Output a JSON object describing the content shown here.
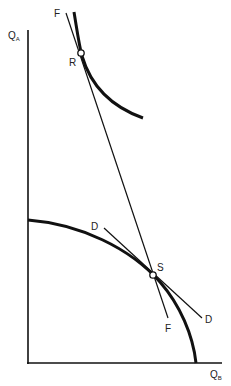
{
  "diagram": {
    "axes": {
      "y_label_main": "Q",
      "y_label_sub": "A",
      "x_label_main": "Q",
      "x_label_sub": "B"
    },
    "curves": {
      "production_possibility_frontier": "bowed-out frontier",
      "indifference_curve": "convex curve through R"
    },
    "lines": {
      "line_FF": {
        "label_top": "F",
        "label_bottom": "F"
      },
      "line_DD": {
        "label_left": "D",
        "label_right": "D"
      }
    },
    "points": {
      "R": "R",
      "S": "S"
    },
    "colors": {
      "ink": "#111111",
      "background": "#ffffff"
    }
  }
}
